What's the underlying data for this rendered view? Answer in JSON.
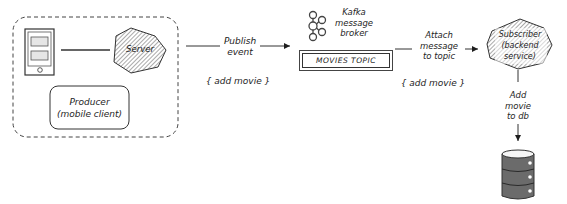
{
  "producer_group": {
    "label": "Producer\n(mobile client)",
    "device_icon": "mobile-device-icon",
    "server_label": "Server"
  },
  "publish_arrow": {
    "label": "Publish\nevent",
    "payload": "{ add movie }"
  },
  "broker": {
    "icon": "kafka-logo-icon",
    "label": "Kafka\nmessage\nbroker",
    "topic_label": "MOVIES TOPIC"
  },
  "attach_arrow": {
    "label": "Attach\nmessage\nto topic",
    "payload": "{ add movie }"
  },
  "subscriber": {
    "label": "Subscriber\n(backend\nservice)"
  },
  "db_arrow": {
    "label": "Add\nmovie\nto db"
  },
  "database": {
    "icon": "database-icon"
  },
  "colors": {
    "stroke": "#1e1e1e",
    "hatch": "#555555",
    "dashed_border": "#444444",
    "db_fill": "#6b6b6b"
  }
}
